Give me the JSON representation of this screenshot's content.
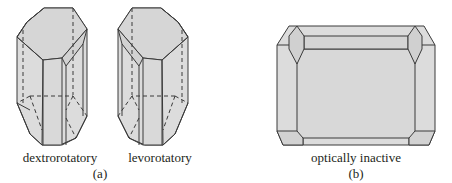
{
  "figure": {
    "panel_a": {
      "caption": "(a)",
      "crystals": [
        {
          "label": "dextrorotatory"
        },
        {
          "label": "levorotatory"
        }
      ]
    },
    "panel_b": {
      "caption": "(b)",
      "crystals": [
        {
          "label": "optically inactive"
        }
      ]
    },
    "colors": {
      "face_fill": "#dcdcdc",
      "edge_stroke": "#3a3a3a",
      "text": "#231f20"
    }
  }
}
